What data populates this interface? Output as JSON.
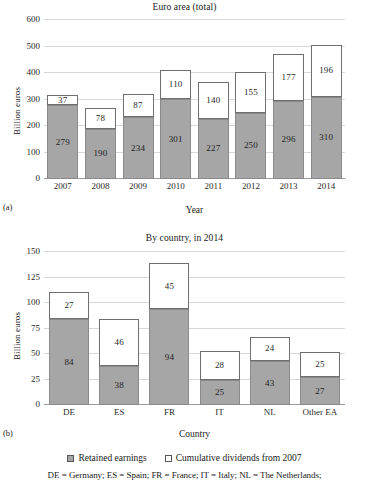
{
  "figure": {
    "panels": [
      {
        "tag": "(a)",
        "title": "Euro area (total)",
        "ylabel": "Billion euros",
        "xlabel": "Year"
      },
      {
        "tag": "(b)",
        "title": "By country, in 2014",
        "ylabel": "Billion euros",
        "xlabel": "Country"
      }
    ],
    "legend": {
      "items": [
        {
          "label": "Retained earnings",
          "swatch": "retained",
          "color": "#a6a6a6"
        },
        {
          "label": "Cumulative dividends from 2007",
          "swatch": "dividends",
          "color": "#ffffff"
        }
      ]
    },
    "footnote": "DE = Germany; ES = Spain; FR = France; IT = Italy; NL = The Netherlands;"
  },
  "chart_data": [
    {
      "type": "bar",
      "stacked": true,
      "title": "Euro area (total)",
      "xlabel": "Year",
      "ylabel": "Billion euros",
      "ylim": [
        0,
        600
      ],
      "yticks": [
        0,
        100,
        200,
        300,
        400,
        500,
        600
      ],
      "grid": true,
      "legend_position": "below-figure",
      "categories": [
        "2007",
        "2008",
        "2009",
        "2010",
        "2011",
        "2012",
        "2013",
        "2014"
      ],
      "series": [
        {
          "name": "Retained earnings",
          "color": "#a6a6a6",
          "values": [
            279,
            190,
            234,
            301,
            227,
            250,
            296,
            310
          ]
        },
        {
          "name": "Cumulative dividends from 2007",
          "color": "#ffffff",
          "values": [
            37,
            78,
            87,
            110,
            140,
            155,
            177,
            196
          ]
        }
      ],
      "totals": [
        316,
        268,
        321,
        411,
        367,
        405,
        473,
        506
      ]
    },
    {
      "type": "bar",
      "stacked": true,
      "title": "By country, in 2014",
      "xlabel": "Country",
      "ylabel": "Billion euros",
      "ylim": [
        0,
        150
      ],
      "yticks": [
        0,
        25,
        50,
        75,
        100,
        125,
        150
      ],
      "grid": true,
      "legend_position": "below-figure",
      "categories": [
        "DE",
        "ES",
        "FR",
        "IT",
        "NL",
        "Other EA"
      ],
      "series": [
        {
          "name": "Retained earnings",
          "color": "#a6a6a6",
          "values": [
            84,
            38,
            94,
            25,
            43,
            27
          ]
        },
        {
          "name": "Cumulative dividends from 2007",
          "color": "#ffffff",
          "values": [
            27,
            46,
            45,
            28,
            24,
            25
          ]
        }
      ],
      "totals": [
        111,
        84,
        139,
        53,
        67,
        52
      ]
    }
  ]
}
